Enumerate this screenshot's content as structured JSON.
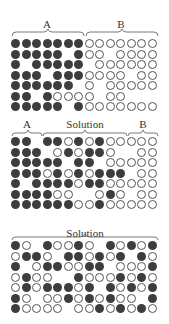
{
  "colors": {
    "filled": "#3d3d3d",
    "open_stroke": "#555555",
    "background": "#ffffff",
    "text": "#333333"
  },
  "legend": {
    "f": "filled circle",
    "o": "open circle",
    "_": "empty position"
  },
  "panels": [
    {
      "id": "top",
      "labels": [
        {
          "text": "A",
          "cols": [
            1,
            7
          ]
        },
        {
          "text": "B",
          "cols": [
            8,
            14
          ]
        }
      ],
      "rows": [
        "fffffffooooooo",
        "fffff_foo_oooo",
        "f_fffff_oooooo",
        "fff_fffoooo_oo",
        "ffffff_o_ooooo",
        "ff_foooo_oo",
        "fffff_fooooooo"
      ]
    },
    {
      "id": "middle",
      "labels": [
        {
          "text": "A",
          "cols": [
            1,
            3
          ]
        },
        {
          "text": "Solution",
          "cols": [
            4,
            11
          ]
        },
        {
          "text": "B",
          "cols": [
            12,
            14
          ]
        }
      ],
      "rows": [
        "ff_ffofofooooo",
        "fff_ofoffo__oo",
        "fffff_ff_ooooo",
        "fffofofofff_oo",
        "f_ffffoffooooo",
        "ffffoo__ofo_oo",
        "ffffffoofooooo"
      ]
    },
    {
      "id": "bottom",
      "labels": [
        {
          "text": "Solution",
          "cols": [
            1,
            14
          ]
        }
      ],
      "rows": [
        "fo_foofo_fofof",
        "offo_ffofof_fo",
        "f_offooff_ooof",
        "ofoo__fooofofo",
        "ofofffof_fofof",
        "fo_oofofofoo_f",
        "foooo_oofofofo"
      ]
    }
  ]
}
